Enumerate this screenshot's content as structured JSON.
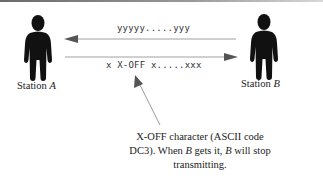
{
  "diagram": {
    "type": "flow-control-illustration",
    "station_a": {
      "label_prefix": "Station ",
      "label_var": "A"
    },
    "station_b": {
      "label_prefix": "Station ",
      "label_var": "B"
    },
    "top_stream": {
      "text": "yyyyy.....yyy",
      "direction": "B-to-A"
    },
    "bottom_stream": {
      "text": "x X-OFF x.....xxx",
      "direction": "A-to-B"
    },
    "annotation": {
      "line1": "X-OFF character (ASCII code",
      "line2_a": "DC3). When ",
      "line2_var1": "B",
      "line2_b": " gets it, ",
      "line2_var2": "B",
      "line2_c": " will stop",
      "line3": "transmitting.",
      "points_to": "X-OFF"
    },
    "colors": {
      "figure": "#111111",
      "arrow_line": "#9a9a9a",
      "arrow_head": "#555555",
      "text": "#222222"
    }
  }
}
